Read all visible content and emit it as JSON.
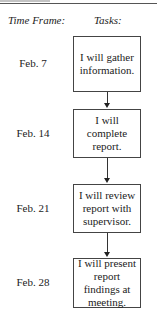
{
  "header": {
    "time_frame_label": "Time Frame:",
    "tasks_label": "Tasks:"
  },
  "steps": [
    {
      "date": "Feb. 7",
      "task": "I will gather information."
    },
    {
      "date": "Feb. 14",
      "task": "I will complete report."
    },
    {
      "date": "Feb. 21",
      "task": "I will review report with supervisor."
    },
    {
      "date": "Feb. 28",
      "task": "I will present report findings at meeting."
    }
  ]
}
